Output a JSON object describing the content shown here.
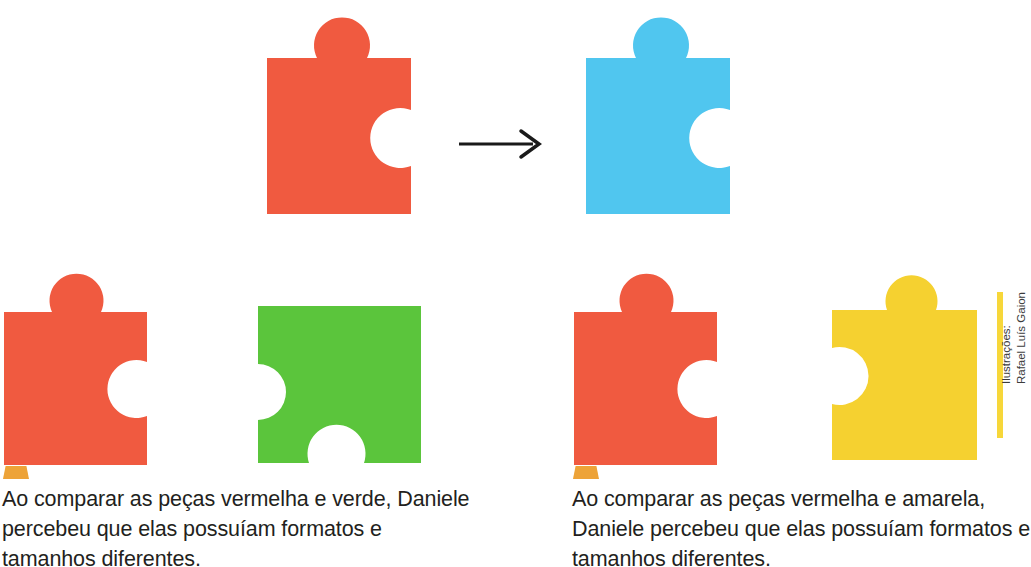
{
  "illustration": {
    "title": "Comparacao de pecas de quebra-cabeca",
    "arrow": {
      "name": "right-arrow",
      "direction": "right",
      "color": "#1a1a1a"
    },
    "colors": {
      "red": "#f05a40",
      "blue": "#50c6ef",
      "green": "#5bc53c",
      "yellow": "#f5d130",
      "marker_orange": "#eda338",
      "credit_bar_yellow": "#f7d73a",
      "text": "#231f20",
      "background": "#ffffff"
    },
    "pieces": [
      {
        "id": "piece-red-top",
        "color_name": "vermelha",
        "color": "#f05a40",
        "tabs": [
          "top"
        ],
        "notches": [
          "right"
        ]
      },
      {
        "id": "piece-blue-top",
        "color_name": "azul",
        "color": "#50c6ef",
        "tabs": [
          "top"
        ],
        "notches": [
          "right"
        ]
      },
      {
        "id": "piece-red-left",
        "color_name": "vermelha",
        "color": "#f05a40",
        "tabs": [
          "top"
        ],
        "notches": [
          "right"
        ]
      },
      {
        "id": "piece-green",
        "color_name": "verde",
        "color": "#5bc53c",
        "tabs": [],
        "notches": [
          "left",
          "bottom"
        ]
      },
      {
        "id": "piece-red-right",
        "color_name": "vermelha",
        "color": "#f05a40",
        "tabs": [
          "top"
        ],
        "notches": [
          "right"
        ]
      },
      {
        "id": "piece-yellow",
        "color_name": "amarela",
        "color": "#f5d130",
        "tabs": [
          "top",
          "left"
        ],
        "notches": []
      }
    ]
  },
  "captions": {
    "left": "Ao comparar as peças vermelha e verde, Daniele percebeu que elas possuíam formatos e tamanhos diferentes.",
    "right": "Ao comparar as peças vermelha e amarela, Daniele percebeu que elas possuíam formatos e tamanhos diferentes."
  },
  "credit": {
    "line1": "Ilustrações:",
    "line2": "Rafael Luís Gaion"
  }
}
